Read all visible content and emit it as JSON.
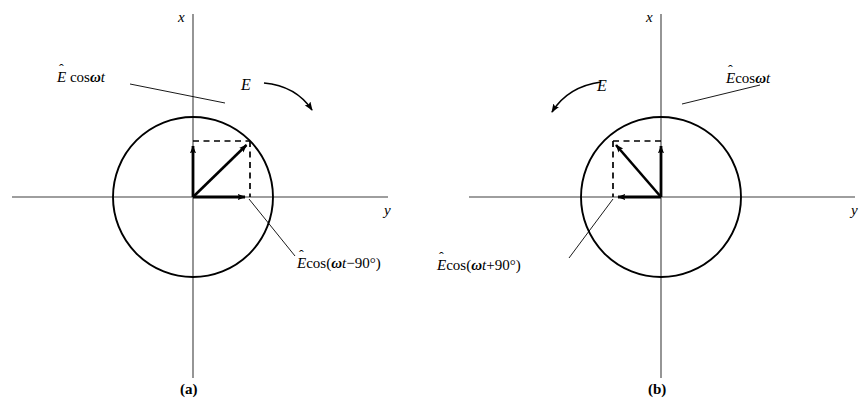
{
  "figure": {
    "background_color": "#ffffff",
    "stroke_color": "#000000",
    "axis_color": "#3a3a3a",
    "panels": [
      {
        "caption": "(a)",
        "rotation_sense": "clockwise",
        "center": {
          "x": 193,
          "y": 197
        },
        "radius": 80,
        "axis_x_label": "x",
        "axis_y_label": "y",
        "resultant_label": "E",
        "component_vertical_label": {
          "hat": "ˆ",
          "base": "E",
          "rest": " cos",
          "omega": "ω",
          "t": "t"
        },
        "component_vertical_text": "Ê cosωt",
        "component_horizontal_text": "Êcos(ωt−90°)",
        "component_horizontal_parts": {
          "hat": "ˆ",
          "base": "E",
          "rest": "cos(",
          "omega": "ω",
          "t": "t",
          "tail": "−90°)"
        },
        "tip": {
          "x": 250,
          "y": 141
        }
      },
      {
        "caption": "(b)",
        "rotation_sense": "counter-clockwise",
        "center": {
          "x": 661,
          "y": 197
        },
        "radius": 80,
        "axis_x_label": "x",
        "axis_y_label": "y",
        "resultant_label": "E",
        "component_vertical_text": "Êcosωt",
        "component_vertical_label": {
          "hat": "ˆ",
          "base": "E",
          "rest": "cos",
          "omega": "ω",
          "t": "t"
        },
        "component_horizontal_text": "Êcos(ωt+90°)",
        "component_horizontal_parts": {
          "hat": "ˆ",
          "base": "E",
          "rest": "cos(",
          "omega": "ω",
          "t": "t",
          "tail": "+90°)"
        },
        "tip": {
          "x": 613,
          "y": 141
        }
      }
    ]
  }
}
